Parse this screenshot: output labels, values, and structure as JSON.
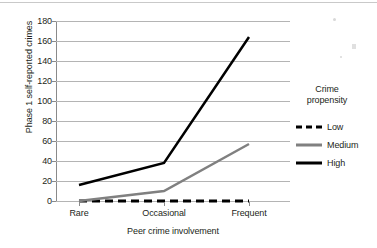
{
  "chart_data": {
    "type": "line",
    "title": "",
    "subtitle": "",
    "xlabel": "Peer crime involvement",
    "ylabel": "Phase 1 self-reported crimes",
    "categories": [
      "Rare",
      "Occasional",
      "Frequent"
    ],
    "ylim": [
      0,
      180
    ],
    "ytick_step": 20,
    "yticks": [
      0,
      20,
      40,
      60,
      80,
      100,
      120,
      140,
      160,
      180
    ],
    "grid": "horizontal",
    "legend_position": "right",
    "legend_title": "Crime propensity",
    "series": [
      {
        "name": "Low",
        "values": [
          0,
          0,
          0
        ],
        "color": "#000000",
        "style": "dashed",
        "width": 3
      },
      {
        "name": "Medium",
        "values": [
          0,
          10,
          57
        ],
        "color": "#808080",
        "style": "solid",
        "width": 2.5
      },
      {
        "name": "High",
        "values": [
          16,
          38,
          164
        ],
        "color": "#000000",
        "style": "solid",
        "width": 2.5
      }
    ]
  },
  "axes": {
    "y_title": "Phase 1 self-reported crimes",
    "x_title": "Peer crime involvement",
    "y_tick_labels": [
      "180",
      "160",
      "140",
      "120",
      "100",
      "80",
      "60",
      "40",
      "20",
      "0"
    ],
    "x_tick_labels": [
      "Rare",
      "Occasional",
      "Frequent"
    ]
  },
  "legend": {
    "title_line1": "Crime",
    "title_line2": "propensity",
    "entries": [
      {
        "label": "Low"
      },
      {
        "label": "Medium"
      },
      {
        "label": "High"
      }
    ]
  },
  "colors": {
    "low": "#000000",
    "medium": "#808080",
    "high": "#000000",
    "grid": "#b4b4b4",
    "axis": "#8a8a8a",
    "text": "#231f20"
  }
}
